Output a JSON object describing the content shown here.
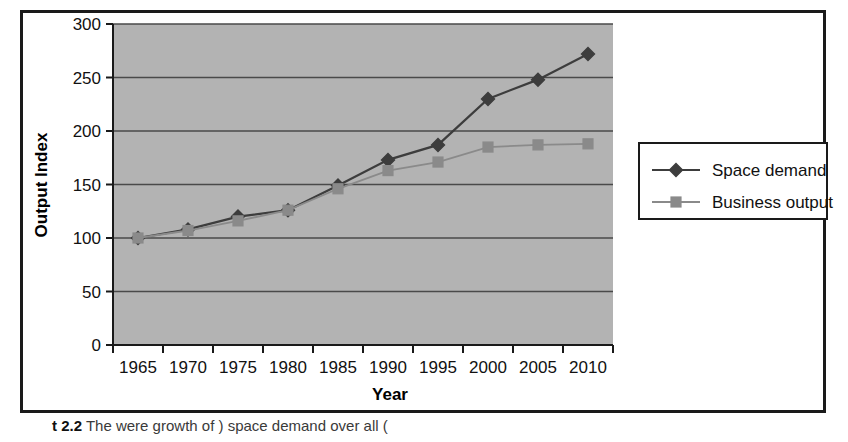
{
  "figure": {
    "caption_prefix": "t 2.2",
    "caption_text": "The were growth of ) space demand over all (",
    "border_color": "#1a1a1a",
    "plot_background": "#b3b3b3",
    "page_background": "#ffffff"
  },
  "chart_data": {
    "type": "line",
    "title": "",
    "xlabel": "Year",
    "ylabel": "Output Index",
    "categories": [
      "1965",
      "1970",
      "1975",
      "1980",
      "1985",
      "1990",
      "1995",
      "2000",
      "2005",
      "2010"
    ],
    "x": [
      1965,
      1970,
      1975,
      1980,
      1985,
      1990,
      1995,
      2000,
      2005,
      2010
    ],
    "series": [
      {
        "name": "Space demand",
        "marker": "diamond",
        "color": "#3d3d3d",
        "values": [
          100,
          108,
          120,
          126,
          149,
          173,
          187,
          230,
          248,
          272
        ]
      },
      {
        "name": "Business output",
        "marker": "square",
        "color": "#8a8a8a",
        "values": [
          100,
          107,
          116,
          126,
          146,
          163,
          171,
          185,
          187,
          188
        ]
      }
    ],
    "ylim": [
      0,
      300
    ],
    "yticks": [
      0,
      50,
      100,
      150,
      200,
      250,
      300
    ],
    "ytick_labels": [
      "0",
      "50",
      "100",
      "150",
      "200",
      "250",
      "300"
    ],
    "grid": true,
    "grid_axis": "y",
    "legend_position": "right"
  },
  "legend": {
    "items": [
      {
        "label": "Space demand",
        "marker": "diamond",
        "color": "#3d3d3d"
      },
      {
        "label": "Business output",
        "marker": "square",
        "color": "#8a8a8a"
      }
    ]
  }
}
